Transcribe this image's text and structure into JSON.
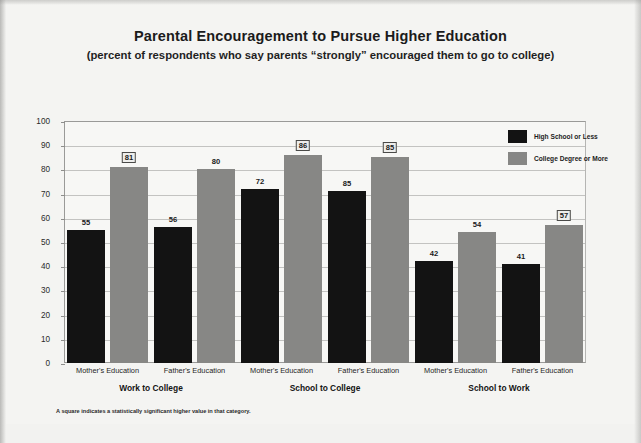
{
  "chart_data": {
    "type": "bar",
    "title": "Parental Encouragement to Pursue Higher Education",
    "subtitle": "(percent of respondents who say parents “strongly” encouraged them to go to college)",
    "xlabel": "",
    "ylabel": "",
    "ylim": [
      0,
      100
    ],
    "ytick_step": 10,
    "yticks": [
      0,
      10,
      20,
      30,
      40,
      50,
      60,
      70,
      80,
      90,
      100
    ],
    "grid": true,
    "legend_position": "top-right",
    "groups": [
      "Work to College",
      "School to College",
      "School to Work"
    ],
    "categories": [
      "Mother's Education",
      "Father's Education",
      "Mother's Education",
      "Father's Education",
      "Mother's Education",
      "Father's Education"
    ],
    "series": [
      {
        "name": "High School or Less",
        "color": "#131313",
        "values": [
          55,
          56,
          72,
          85,
          42,
          41
        ],
        "significant": [
          false,
          false,
          false,
          false,
          false,
          false
        ]
      },
      {
        "name": "College Degree or More",
        "color": "#878785",
        "values": [
          81,
          80,
          86,
          85,
          54,
          57
        ],
        "significant": [
          true,
          false,
          true,
          true,
          false,
          true
        ]
      }
    ],
    "bars": [
      {
        "group": "Work to College",
        "category": "Mother's Education",
        "series": "High School or Less",
        "label": "55",
        "value": 55,
        "height_value": 55,
        "significant": false
      },
      {
        "group": "Work to College",
        "category": "Mother's Education",
        "series": "College Degree or More",
        "label": "81",
        "value": 81,
        "height_value": 81,
        "significant": true
      },
      {
        "group": "Work to College",
        "category": "Father's Education",
        "series": "High School or Less",
        "label": "56",
        "value": 56,
        "height_value": 56,
        "significant": false
      },
      {
        "group": "Work to College",
        "category": "Father's Education",
        "series": "College Degree or More",
        "label": "80",
        "value": 80,
        "height_value": 80,
        "significant": false
      },
      {
        "group": "School to College",
        "category": "Mother's Education",
        "series": "High School or Less",
        "label": "72",
        "value": 72,
        "height_value": 72,
        "significant": false
      },
      {
        "group": "School to College",
        "category": "Mother's Education",
        "series": "College Degree or More",
        "label": "86",
        "value": 86,
        "height_value": 86,
        "significant": true
      },
      {
        "group": "School to College",
        "category": "Father's Education",
        "series": "High School or Less",
        "label": "85",
        "value": 85,
        "height_value": 71,
        "significant": false
      },
      {
        "group": "School to College",
        "category": "Father's Education",
        "series": "College Degree or More",
        "label": "85",
        "value": 85,
        "height_value": 85,
        "significant": true
      },
      {
        "group": "School to Work",
        "category": "Mother's Education",
        "series": "High School or Less",
        "label": "42",
        "value": 42,
        "height_value": 42,
        "significant": false
      },
      {
        "group": "School to Work",
        "category": "Mother's Education",
        "series": "College Degree or More",
        "label": "54",
        "value": 54,
        "height_value": 54,
        "significant": false
      },
      {
        "group": "School to Work",
        "category": "Father's Education",
        "series": "High School or Less",
        "label": "41",
        "value": 41,
        "height_value": 41,
        "significant": false
      },
      {
        "group": "School to Work",
        "category": "Father's Education",
        "series": "College Degree or More",
        "label": "57",
        "value": 57,
        "height_value": 57,
        "significant": true
      }
    ],
    "annotations": [
      "A square indicates a statistically significant higher value in that category."
    ]
  },
  "legend": {
    "items": [
      {
        "label": "High School or Less",
        "color": "#131313"
      },
      {
        "label": "College Degree or More",
        "color": "#878785"
      }
    ]
  },
  "footnote": "A square indicates a statistically significant higher value in that category."
}
